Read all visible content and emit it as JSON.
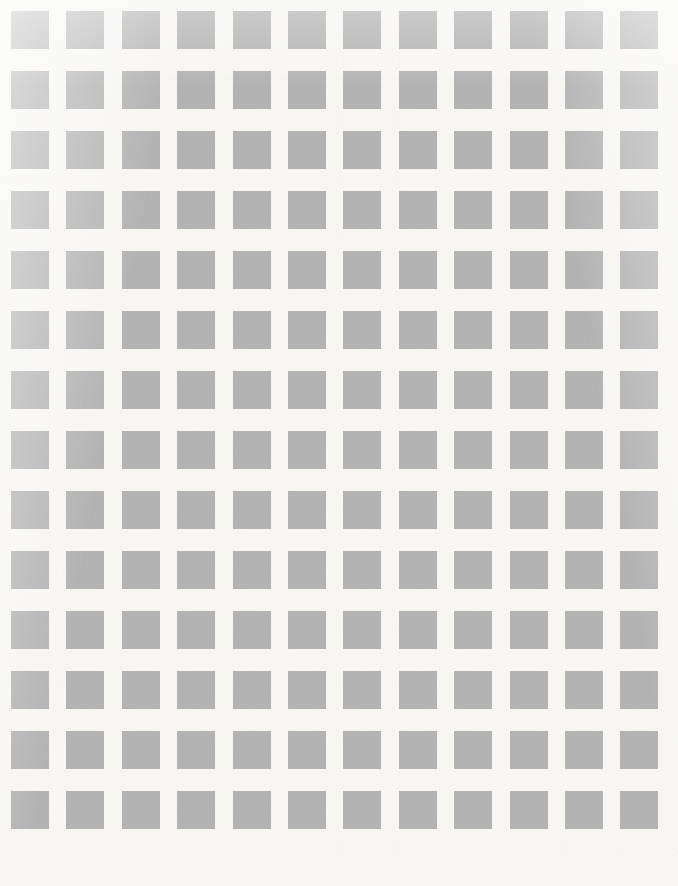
{
  "document": {
    "title": "Gray Square Grid Pattern",
    "type": "abstract-pattern",
    "width_px": 678,
    "height_px": 886
  },
  "pattern": {
    "name": "uniform-square-grid",
    "columns": 12,
    "rows": 14,
    "total_squares": 168,
    "square_width_px": 38,
    "square_height_px": 38,
    "column_pitch_px": 55.4,
    "row_pitch_px": 60.0,
    "origin_x_px": 11,
    "origin_y_px": 11,
    "horizontal_gap_px": 17.4,
    "vertical_gap_px": 22.0,
    "margin_left_px": 11,
    "margin_top_px": 11,
    "margin_right_px": 18,
    "margin_bottom_px": 29
  },
  "colors": {
    "background": "#f7f6f3",
    "square_fill": "#b3b3b3",
    "page_white": "#ffffff"
  },
  "texture": {
    "grain_enabled": true,
    "vignette_enabled": true,
    "edge_softness": "slight-blur"
  }
}
